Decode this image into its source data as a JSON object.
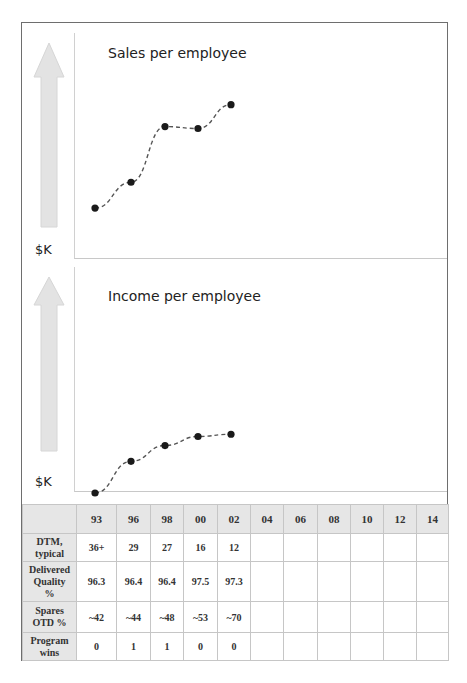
{
  "chart_data": [
    {
      "type": "line",
      "title": "Sales per employee",
      "ylabel": "$K",
      "x": [
        "93",
        "96",
        "98",
        "00",
        "02"
      ],
      "values_relative": [
        0.12,
        0.25,
        0.53,
        0.52,
        0.64
      ],
      "line_style": "dashed",
      "marker": "circle",
      "grid": false,
      "note": "No numeric y-axis ticks shown; values are relative heights within plot (0 = baseline, 1 = top)"
    },
    {
      "type": "line",
      "title": "Income per employee",
      "ylabel": "$K",
      "x": [
        "93",
        "96",
        "98",
        "00",
        "02"
      ],
      "values_relative": [
        0.0,
        0.14,
        0.21,
        0.25,
        0.26
      ],
      "line_style": "dashed",
      "marker": "circle",
      "grid": false,
      "note": "No numeric y-axis ticks shown; values are relative heights within plot"
    },
    {
      "type": "table",
      "columns": [
        "93",
        "96",
        "98",
        "00",
        "02",
        "04",
        "06",
        "08",
        "10",
        "12",
        "14"
      ],
      "rows": [
        {
          "label": "DTM, typical",
          "values": [
            "36+",
            "29",
            "27",
            "16",
            "12",
            "",
            "",
            "",
            "",
            "",
            ""
          ]
        },
        {
          "label": "Delivered Quality %",
          "values": [
            "96.3",
            "96.4",
            "96.4",
            "97.5",
            "97.3",
            "",
            "",
            "",
            "",
            "",
            ""
          ]
        },
        {
          "label": "Spares OTD %",
          "values": [
            "~42",
            "~44",
            "~48",
            "~53",
            "~70",
            "",
            "",
            "",
            "",
            "",
            ""
          ]
        },
        {
          "label": "Program wins",
          "values": [
            "0",
            "1",
            "1",
            "0",
            "0",
            "",
            "",
            "",
            "",
            "",
            ""
          ]
        }
      ]
    }
  ],
  "charts": {
    "sales": {
      "title": "Sales per employee",
      "unit": "$K",
      "arrow_icon": "up-arrow-icon"
    },
    "income": {
      "title": "Income per employee",
      "unit": "$K",
      "arrow_icon": "up-arrow-icon"
    }
  },
  "table": {
    "corner": "",
    "columns": [
      "93",
      "96",
      "98",
      "00",
      "02",
      "04",
      "06",
      "08",
      "10",
      "12",
      "14"
    ],
    "rows": [
      {
        "label_lines": [
          "DTM,",
          "typical"
        ],
        "values": [
          "36+",
          "29",
          "27",
          "16",
          "12",
          "",
          "",
          "",
          "",
          "",
          ""
        ]
      },
      {
        "label_lines": [
          "Delivered",
          "Quality",
          "%"
        ],
        "values": [
          "96.3",
          "96.4",
          "96.4",
          "97.5",
          "97.3",
          "",
          "",
          "",
          "",
          "",
          ""
        ]
      },
      {
        "label_lines": [
          "Spares",
          "OTD %"
        ],
        "values": [
          "~42",
          "~44",
          "~48",
          "~53",
          "~70",
          "",
          "",
          "",
          "",
          "",
          ""
        ]
      },
      {
        "label_lines": [
          "Program",
          "wins"
        ],
        "values": [
          "0",
          "1",
          "1",
          "0",
          "0",
          "",
          "",
          "",
          "",
          "",
          ""
        ]
      }
    ]
  },
  "colors": {
    "arrow_fill": "#e3e3e3",
    "arrow_stroke": "#d6d6d6",
    "marker": "#1a1a1a",
    "line": "#555555",
    "header_bg": "#e6e6e6",
    "frame": "#6e6e6e"
  }
}
